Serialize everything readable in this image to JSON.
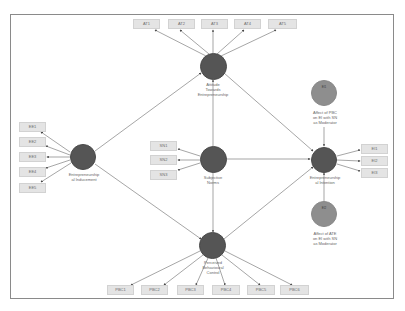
{
  "diagram": {
    "type": "structural-equation-model",
    "colors": {
      "latent_node": "#555555",
      "moderator_node": "#8e8e8e",
      "indicator_box": "#e4e4e4",
      "edge": "#6a6a6a",
      "frame": "#8a8a8a"
    },
    "latent_constructs": [
      {
        "id": "ate",
        "label": "Attitude\nTowards\nEntrepreneurship"
      },
      {
        "id": "eind",
        "label": "Entrepreneurship\nal Inducement"
      },
      {
        "id": "sn",
        "label": "Subjective\nNorms"
      },
      {
        "id": "ei",
        "label": "Entrepreneurship\nal Intention"
      },
      {
        "id": "pbc",
        "label": "Perceived\nBehavioural\nControl"
      }
    ],
    "moderators": [
      {
        "id": "mod1",
        "badge": "EI1",
        "label": "Affect of PBC\non EI with SN\nas Moderator"
      },
      {
        "id": "mod2",
        "badge": "EI2",
        "label": "Affect of ATE\non EI with SN\nas Moderator"
      }
    ],
    "indicators": {
      "ate": [
        "AT1",
        "AT2",
        "AT3",
        "AT4",
        "AT5"
      ],
      "eind": [
        "EE1",
        "EE2",
        "EE3",
        "EE4",
        "EE5"
      ],
      "sn": [
        "SN1",
        "SN2",
        "SN3"
      ],
      "ei": [
        "EI1",
        "EI2",
        "EI3"
      ],
      "pbc": [
        "PBC1",
        "PBC2",
        "PBC3",
        "PBC4",
        "PBC5",
        "PBC6"
      ]
    },
    "paths": [
      {
        "from": "eind",
        "to": "ate"
      },
      {
        "from": "eind",
        "to": "pbc"
      },
      {
        "from": "sn",
        "to": "ate"
      },
      {
        "from": "sn",
        "to": "pbc"
      },
      {
        "from": "sn",
        "to": "ei"
      },
      {
        "from": "ate",
        "to": "ei"
      },
      {
        "from": "pbc",
        "to": "ei"
      },
      {
        "from": "mod1",
        "to": "ei"
      },
      {
        "from": "mod2",
        "to": "ei"
      }
    ]
  }
}
